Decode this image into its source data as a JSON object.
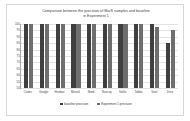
{
  "chart_data": {
    "type": "bar",
    "title": "Comparison between the precision of MarS samples and baseline in Experiment 1",
    "title_line1": "Comparison between the precision of MarS samples and baseline",
    "title_line2": "in Experiment 1",
    "xlabel": "",
    "ylabel": "",
    "ylim": [
      50,
      100
    ],
    "grid": true,
    "legend_position": "bottom",
    "categories": [
      "Codec",
      "Google",
      "Hexbox",
      "Mixerd",
      "Nimb",
      "Nascay",
      "Sahlo",
      "Tabba",
      "Vivel",
      "Drex"
    ],
    "ytick_labels": [
      "100",
      "95",
      "90",
      "85",
      "80",
      "75",
      "70",
      "65",
      "60",
      "55",
      "50"
    ],
    "ytick_values": [
      100,
      95,
      90,
      85,
      80,
      75,
      70,
      65,
      60,
      55,
      50
    ],
    "series": [
      {
        "name": "baseline precision",
        "color": "#3f3f3f",
        "values": [
          100,
          100,
          100,
          100,
          100,
          100,
          100,
          100,
          100,
          85
        ]
      },
      {
        "name": "Experiment 1 precision",
        "color": "#6e6e6e",
        "values": [
          100,
          100,
          100,
          100,
          100,
          100,
          100,
          100,
          98,
          95
        ]
      }
    ]
  }
}
